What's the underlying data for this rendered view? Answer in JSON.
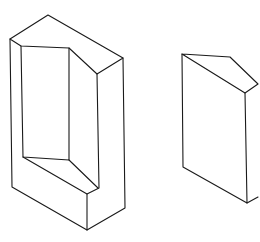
{
  "figure": {
    "type": "isometric line drawing",
    "stroke_color": "#1a1a1a",
    "background": "#ffffff",
    "shapes": [
      {
        "name": "notched-block",
        "polylines": [
          [
            [
              10,
              39
            ],
            [
              48,
              15
            ],
            [
              123,
              58
            ],
            [
              97,
              74
            ],
            [
              69,
              48
            ],
            [
              21,
              46
            ],
            [
              10,
              39
            ]
          ],
          [
            [
              10,
              39
            ],
            [
              12,
              187
            ],
            [
              87,
              230
            ],
            [
              125,
              208
            ],
            [
              123,
              58
            ]
          ],
          [
            [
              21,
              46
            ],
            [
              23,
              157
            ],
            [
              69,
              160
            ],
            [
              69,
              48
            ]
          ],
          [
            [
              23,
              157
            ],
            [
              87,
              194
            ],
            [
              99,
              188
            ],
            [
              97,
              74
            ]
          ],
          [
            [
              69,
              160
            ],
            [
              98,
              188
            ]
          ],
          [
            [
              87,
              194
            ],
            [
              87,
              230
            ]
          ]
        ]
      },
      {
        "name": "wedge-block",
        "polylines": [
          [
            [
              182,
              54
            ],
            [
              230,
              57
            ],
            [
              258,
              84
            ],
            [
              245,
              93
            ],
            [
              182,
              54
            ]
          ],
          [
            [
              182,
              54
            ],
            [
              183,
              167
            ],
            [
              247,
              203
            ],
            [
              245,
              93
            ]
          ],
          [
            [
              247,
              203
            ],
            [
              258,
              197
            ]
          ]
        ]
      }
    ]
  },
  "caption": ""
}
